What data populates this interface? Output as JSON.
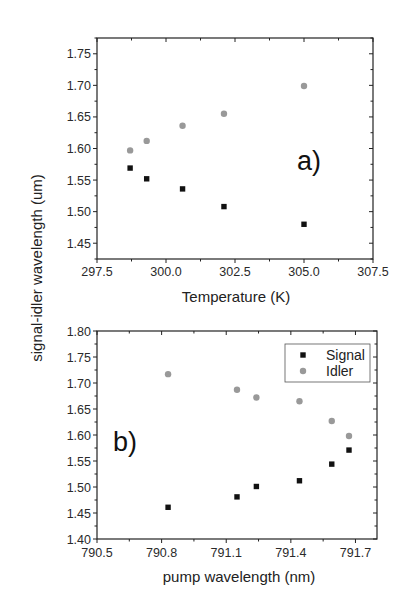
{
  "figure": {
    "shared_ylabel": "signal-idler wavelength (um)"
  },
  "chart_data": [
    {
      "type": "scatter",
      "panel_label": "a)",
      "title": "",
      "xlabel": "Temperature (K)",
      "ylabel": "signal-idler wavelength (um)",
      "xlim": [
        297.5,
        307.5
      ],
      "ylim": [
        1.425,
        1.775
      ],
      "xticks": [
        297.5,
        300.0,
        302.5,
        305.0,
        307.5
      ],
      "xtick_labels": [
        "297.5",
        "300.0",
        "302.5",
        "305.0",
        "307.5"
      ],
      "yticks": [
        1.45,
        1.5,
        1.55,
        1.6,
        1.65,
        1.7,
        1.75
      ],
      "ytick_labels": [
        "1.45",
        "1.50",
        "1.55",
        "1.60",
        "1.65",
        "1.70",
        "1.75"
      ],
      "grid": false,
      "legend": null,
      "series": [
        {
          "name": "Signal",
          "marker": "square",
          "color": "#111111",
          "x": [
            298.7,
            299.3,
            300.6,
            302.1,
            305.0
          ],
          "y": [
            1.569,
            1.552,
            1.536,
            1.508,
            1.48
          ]
        },
        {
          "name": "Idler",
          "marker": "circle",
          "color": "#999999",
          "x": [
            298.7,
            299.3,
            300.6,
            302.1,
            305.0
          ],
          "y": [
            1.597,
            1.612,
            1.636,
            1.655,
            1.699
          ]
        }
      ]
    },
    {
      "type": "scatter",
      "panel_label": "b)",
      "title": "",
      "xlabel": "pump wavelength (nm)",
      "ylabel": "signal-idler wavelength (um)",
      "xlim": [
        790.5,
        791.8
      ],
      "ylim": [
        1.4,
        1.8
      ],
      "xticks": [
        790.5,
        790.8,
        791.1,
        791.4,
        791.7
      ],
      "xtick_labels": [
        "790.5",
        "790.8",
        "791.1",
        "791.4",
        "791.7"
      ],
      "yticks": [
        1.4,
        1.45,
        1.5,
        1.55,
        1.6,
        1.65,
        1.7,
        1.75,
        1.8
      ],
      "ytick_labels": [
        "1.40",
        "1.45",
        "1.50",
        "1.55",
        "1.60",
        "1.65",
        "1.70",
        "1.75",
        "1.80"
      ],
      "grid": false,
      "legend": {
        "position": "upper right",
        "entries": [
          "Signal",
          "Idler"
        ]
      },
      "series": [
        {
          "name": "Signal",
          "marker": "square",
          "color": "#111111",
          "x": [
            790.83,
            791.15,
            791.24,
            791.44,
            791.59,
            791.67
          ],
          "y": [
            1.461,
            1.481,
            1.501,
            1.512,
            1.544,
            1.571
          ]
        },
        {
          "name": "Idler",
          "marker": "circle",
          "color": "#999999",
          "x": [
            790.83,
            791.15,
            791.24,
            791.44,
            791.59,
            791.67
          ],
          "y": [
            1.717,
            1.687,
            1.672,
            1.665,
            1.627,
            1.598
          ]
        }
      ]
    }
  ]
}
